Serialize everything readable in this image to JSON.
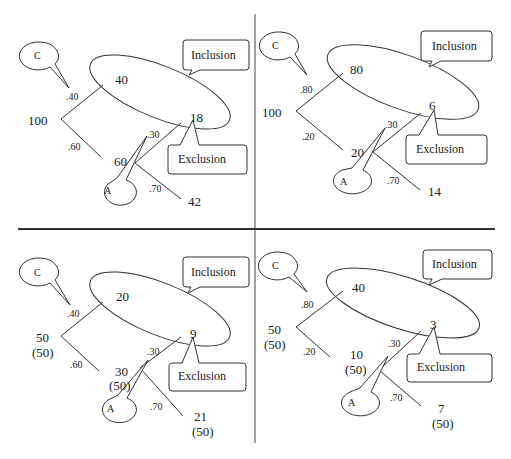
{
  "labels": {
    "inclusion": "Inclusion",
    "exclusion": "Exclusion",
    "c": "C",
    "a": "A"
  },
  "panels": [
    {
      "id": "top-left",
      "root": "100",
      "root_sub": "",
      "p_upper": ".40",
      "p_lower": ".60",
      "upper_value": "40",
      "lower_value": "60",
      "lower_sub": "",
      "p_a_upper": ".30",
      "p_a_lower": ".70",
      "inclusion_value": "18",
      "exclusion_end_value": "42",
      "exclusion_end_sub": ""
    },
    {
      "id": "top-right",
      "root": "100",
      "root_sub": "",
      "p_upper": ".80",
      "p_lower": ".20",
      "upper_value": "80",
      "lower_value": "20",
      "lower_sub": "",
      "p_a_upper": ".30",
      "p_a_lower": ".70",
      "inclusion_value": "6",
      "exclusion_end_value": "14",
      "exclusion_end_sub": ""
    },
    {
      "id": "bottom-left",
      "root": "50",
      "root_sub": "(50)",
      "p_upper": ".40",
      "p_lower": ".60",
      "upper_value": "20",
      "lower_value": "30",
      "lower_sub": "(50)",
      "p_a_upper": ".30",
      "p_a_lower": ".70",
      "inclusion_value": "9",
      "exclusion_end_value": "21",
      "exclusion_end_sub": "(50)"
    },
    {
      "id": "bottom-right",
      "root": "50",
      "root_sub": "(50)",
      "p_upper": ".80",
      "p_lower": ".20",
      "upper_value": "40",
      "lower_value": "10",
      "lower_sub": "(50)",
      "p_a_upper": ".30",
      "p_a_lower": ".70",
      "inclusion_value": "3",
      "exclusion_end_value": "7",
      "exclusion_end_sub": "(50)"
    }
  ]
}
